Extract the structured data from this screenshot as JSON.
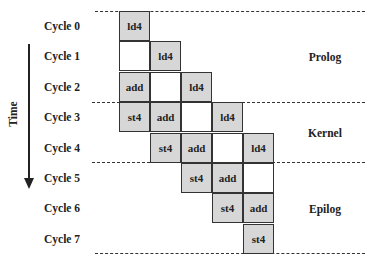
{
  "axis": {
    "label": "Time",
    "direction": "down"
  },
  "cycles": [
    "Cycle 0",
    "Cycle 1",
    "Cycle 2",
    "Cycle 3",
    "Cycle 4",
    "Cycle 5",
    "Cycle 6",
    "Cycle 7"
  ],
  "phases": [
    {
      "label": "Prolog",
      "from_cycle": 0,
      "to_cycle": 2
    },
    {
      "label": "Kernel",
      "from_cycle": 3,
      "to_cycle": 4
    },
    {
      "label": "Epilog",
      "from_cycle": 5,
      "to_cycle": 7
    }
  ],
  "grid": [
    {
      "cycle": 0,
      "cells": [
        {
          "col": 0,
          "text": "ld4"
        }
      ]
    },
    {
      "cycle": 1,
      "cells": [
        {
          "col": 0,
          "text": ""
        },
        {
          "col": 1,
          "text": "ld4"
        }
      ]
    },
    {
      "cycle": 2,
      "cells": [
        {
          "col": 0,
          "text": "add"
        },
        {
          "col": 1,
          "text": ""
        },
        {
          "col": 2,
          "text": "ld4"
        }
      ]
    },
    {
      "cycle": 3,
      "cells": [
        {
          "col": 0,
          "text": "st4"
        },
        {
          "col": 1,
          "text": "add"
        },
        {
          "col": 2,
          "text": ""
        },
        {
          "col": 3,
          "text": "ld4"
        }
      ]
    },
    {
      "cycle": 4,
      "cells": [
        {
          "col": 1,
          "text": "st4"
        },
        {
          "col": 2,
          "text": "add"
        },
        {
          "col": 3,
          "text": ""
        },
        {
          "col": 4,
          "text": "ld4"
        }
      ]
    },
    {
      "cycle": 5,
      "cells": [
        {
          "col": 2,
          "text": "st4"
        },
        {
          "col": 3,
          "text": "add"
        },
        {
          "col": 4,
          "text": ""
        }
      ]
    },
    {
      "cycle": 6,
      "cells": [
        {
          "col": 3,
          "text": "st4"
        },
        {
          "col": 4,
          "text": "add"
        }
      ]
    },
    {
      "cycle": 7,
      "cells": [
        {
          "col": 4,
          "text": "st4"
        }
      ]
    }
  ],
  "colors": {
    "cell_fill": "#d7d7d7",
    "border": "#333333",
    "background": "#ffffff"
  }
}
